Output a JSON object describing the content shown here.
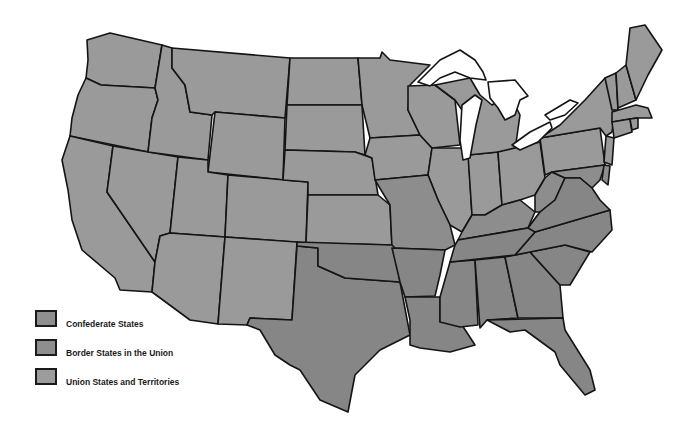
{
  "map": {
    "colors": {
      "confederate": "#858585",
      "border": "#8c8c8c",
      "union": "#999999",
      "outline": "#141414",
      "water": "#ffffff"
    }
  },
  "legend": {
    "items": [
      {
        "label": "Confederate States",
        "color": "#8f8f8f"
      },
      {
        "label": "Border States in the Union",
        "color": "#8e8e8e"
      },
      {
        "label": "Union States and Territories",
        "color": "#9c9c9c"
      }
    ]
  }
}
